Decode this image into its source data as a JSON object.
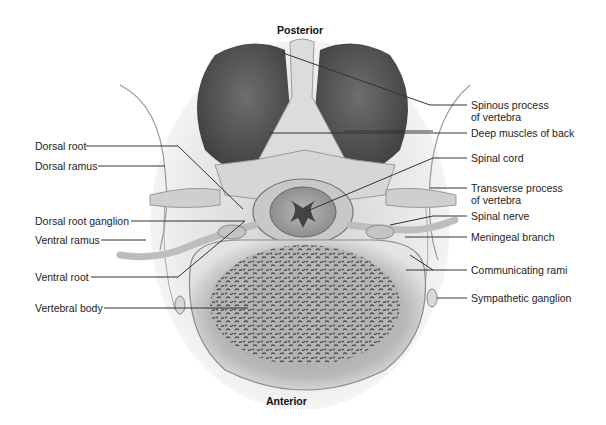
{
  "figure": {
    "orientation": {
      "top": "Posterior",
      "bottom": "Anterior"
    },
    "labels_left": [
      {
        "id": "dorsal-root",
        "text": "Dorsal root"
      },
      {
        "id": "dorsal-ramus",
        "text": "Dorsal ramus"
      },
      {
        "id": "dorsal-root-ganglion",
        "text": "Dorsal root ganglion"
      },
      {
        "id": "ventral-ramus",
        "text": "Ventral ramus"
      },
      {
        "id": "ventral-root",
        "text": "Ventral root"
      },
      {
        "id": "vertebral-body",
        "text": "Vertebral body"
      }
    ],
    "labels_right": [
      {
        "id": "spinous-process",
        "text": "Spinous process\nof vertebra"
      },
      {
        "id": "deep-muscles",
        "text": "Deep muscles of back"
      },
      {
        "id": "spinal-cord",
        "text": "Spinal cord"
      },
      {
        "id": "transverse-process",
        "text": "Transverse process\nof vertebra"
      },
      {
        "id": "spinal-nerve",
        "text": "Spinal nerve"
      },
      {
        "id": "meningeal-branch",
        "text": "Meningeal branch"
      },
      {
        "id": "communicating-rami",
        "text": "Communicating rami"
      },
      {
        "id": "sympathetic-ganglion",
        "text": "Sympathetic ganglion"
      }
    ]
  },
  "colors": {
    "background": "#ffffff",
    "muscle": "#5a5a5a",
    "bone": "#d8d8d8",
    "leader_line": "#333333",
    "label_text": "#222222"
  }
}
